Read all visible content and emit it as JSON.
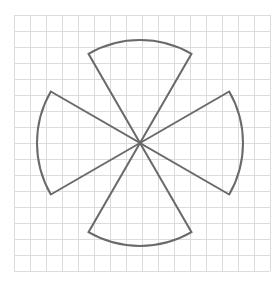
{
  "figure": {
    "grid": {
      "columns": 16,
      "rows": 16,
      "line_color": "#dcdcdc"
    },
    "shape": {
      "stroke_color": "#6a6a6a",
      "fill": "none",
      "sector_count": 4,
      "sector_angle_deg": 60,
      "sector_orientations": [
        "up",
        "right",
        "down",
        "left"
      ]
    }
  }
}
